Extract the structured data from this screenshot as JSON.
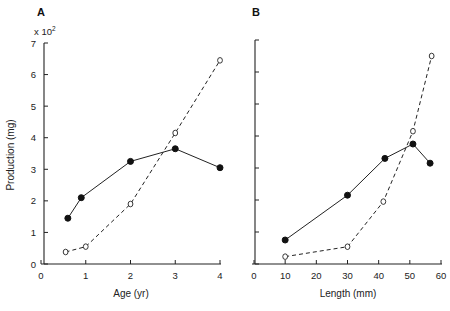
{
  "chart_data": [
    {
      "type": "line",
      "panel": "A",
      "xlabel": "Age (yr)",
      "ylabel": "Production (mg)",
      "y_multiplier": "x 10²",
      "xlim": [
        0,
        4
      ],
      "ylim": [
        0,
        7
      ],
      "xticks": [
        "0",
        "1",
        "2",
        "3",
        "4"
      ],
      "yticks": [
        "0",
        "1",
        "2",
        "3",
        "4",
        "5",
        "6",
        "7"
      ],
      "grid": false,
      "series": [
        {
          "name": "filled",
          "marker": "filled-circle",
          "line": "solid",
          "x": [
            0.6,
            0.9,
            2.0,
            3.0,
            4.0
          ],
          "y": [
            1.45,
            2.1,
            3.25,
            3.65,
            3.05
          ]
        },
        {
          "name": "open",
          "marker": "open-circle",
          "line": "dashed",
          "x": [
            0.55,
            1.0,
            2.0,
            3.0,
            4.0
          ],
          "y": [
            0.38,
            0.55,
            1.9,
            4.15,
            6.45
          ]
        }
      ]
    },
    {
      "type": "line",
      "panel": "B",
      "xlabel": "Length (mm)",
      "ylabel": "",
      "xlim": [
        0,
        60
      ],
      "ylim": [
        0,
        7
      ],
      "xticks": [
        "0",
        "10",
        "20",
        "30",
        "40",
        "50",
        "60"
      ],
      "grid": false,
      "series": [
        {
          "name": "filled",
          "marker": "filled-circle",
          "line": "solid",
          "x": [
            10,
            30,
            42,
            51,
            56.5
          ],
          "y": [
            0.75,
            2.15,
            3.3,
            3.75,
            3.15
          ]
        },
        {
          "name": "open",
          "marker": "open-circle",
          "line": "dashed",
          "x": [
            10,
            30,
            41.5,
            51,
            57
          ],
          "y": [
            0.23,
            0.54,
            1.95,
            4.15,
            6.5
          ]
        }
      ]
    }
  ],
  "labels": {
    "panel_a": "A",
    "panel_b": "B",
    "multiplier_base": "x 10",
    "multiplier_exp": "2",
    "ylabel": "Production (mg)",
    "xlabel_a": "Age (yr)",
    "xlabel_b": "Length (mm)"
  }
}
